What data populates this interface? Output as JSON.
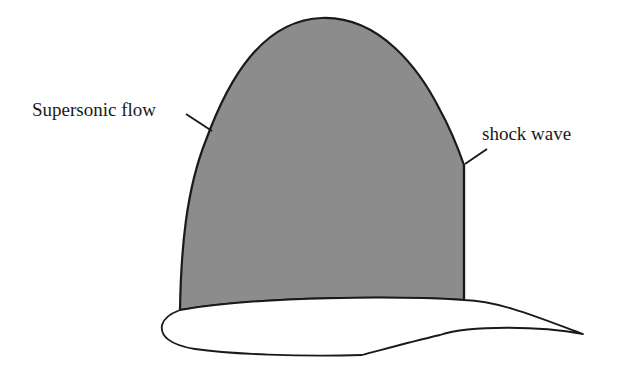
{
  "diagram": {
    "title": "",
    "labels": {
      "supersonic_flow": "Supersonic flow",
      "shock_wave": "shock wave"
    },
    "colors": {
      "supersonic_region_fill": "#8c8c8c",
      "outline": "#1a1a1a",
      "airfoil_fill": "#ffffff",
      "background": "#ffffff"
    },
    "elements": [
      {
        "id": "supersonic-region",
        "description": "Gray dome-shaped supersonic flow region above airfoil"
      },
      {
        "id": "shock-wave",
        "description": "Vertical line terminating supersonic region"
      },
      {
        "id": "airfoil",
        "description": "Airfoil cross-section with rounded leading edge and sharp trailing edge"
      }
    ]
  }
}
